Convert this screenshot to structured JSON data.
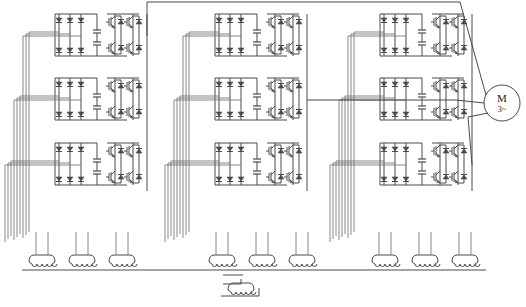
{
  "diagram": {
    "type": "cascaded H-bridge multilevel inverter",
    "line_color": "#4a4a4a",
    "background": "#ffffff",
    "columns": [
      {
        "id": "column-1",
        "x": 35
      },
      {
        "id": "column-2",
        "x": 195
      },
      {
        "id": "column-3",
        "x": 360
      }
    ],
    "rows": [
      {
        "id": "row-1",
        "y": 6
      },
      {
        "id": "row-2",
        "y": 70
      },
      {
        "id": "row-3",
        "y": 135
      }
    ],
    "cell": {
      "rectifier_diodes": 6,
      "dc_capacitors": 2,
      "igbt_switches": 4,
      "freewheel_diodes": 4
    },
    "motor": {
      "label": "M",
      "sublabel": "3~",
      "cx": 502,
      "cy": 103,
      "r": 18
    },
    "transformer": {
      "secondary_windings": [
        {
          "x": 42
        },
        {
          "x": 82
        },
        {
          "x": 122
        },
        {
          "x": 222
        },
        {
          "x": 262
        },
        {
          "x": 302
        },
        {
          "x": 385
        },
        {
          "x": 425
        },
        {
          "x": 465
        }
      ],
      "winding_y": 262,
      "bus_y": 270,
      "primary": {
        "x": 241,
        "y": 290
      }
    }
  }
}
